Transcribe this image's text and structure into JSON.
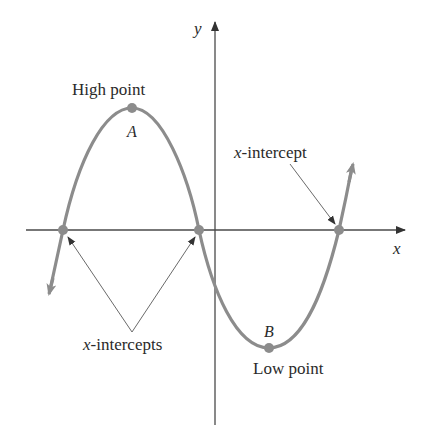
{
  "diagram": {
    "type": "function-graph",
    "axes": {
      "x_label": "x",
      "y_label": "y"
    },
    "points": {
      "high": {
        "letter": "A",
        "caption": "High point"
      },
      "low": {
        "letter": "B",
        "caption": "Low point"
      }
    },
    "annotations": {
      "x_intercept_single": "-intercept",
      "x_intercept_single_var": "x",
      "x_intercepts_plural": "-intercepts",
      "x_intercepts_plural_var": "x"
    },
    "colors": {
      "curve": "#8c8c8c",
      "axes": "#4a4a4a",
      "pointer": "#6a6a6a",
      "dot": "#8c8c8c"
    }
  }
}
